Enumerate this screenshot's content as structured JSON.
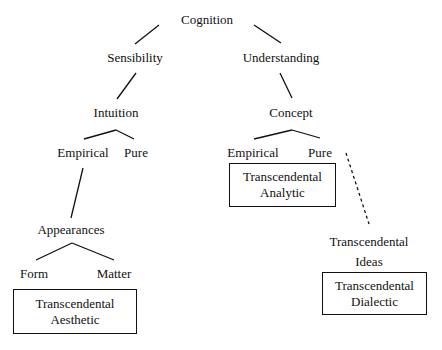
{
  "nodes": {
    "cognition": "Cognition",
    "sensibility": "Sensibility",
    "understanding": "Understanding",
    "intuition": "Intuition",
    "concept": "Concept",
    "intuition_empirical": "Empirical",
    "intuition_pure": "Pure",
    "concept_empirical": "Empirical",
    "concept_pure": "Pure",
    "appearances": "Appearances",
    "form": "Form",
    "matter": "Matter",
    "transcendental_ideas": [
      "Transcendental",
      "Ideas"
    ]
  },
  "boxes": {
    "aesthetic": [
      "Transcendental",
      "Aesthetic"
    ],
    "analytic": [
      "Transcendental",
      "Analytic"
    ],
    "dialectic": [
      "Transcendental",
      "Dialectic"
    ]
  },
  "edges": [
    {
      "from": "Cognition",
      "to": "Sensibility",
      "style": "solid"
    },
    {
      "from": "Cognition",
      "to": "Understanding",
      "style": "solid"
    },
    {
      "from": "Sensibility",
      "to": "Intuition",
      "style": "solid"
    },
    {
      "from": "Understanding",
      "to": "Concept",
      "style": "solid"
    },
    {
      "from": "Intuition",
      "to": "Empirical",
      "style": "solid"
    },
    {
      "from": "Intuition",
      "to": "Pure",
      "style": "solid"
    },
    {
      "from": "Concept",
      "to": "Empirical",
      "style": "solid"
    },
    {
      "from": "Concept",
      "to": "Pure",
      "style": "solid"
    },
    {
      "from": "Empirical",
      "to": "Appearances",
      "style": "solid"
    },
    {
      "from": "Appearances",
      "to": "Form",
      "style": "solid"
    },
    {
      "from": "Appearances",
      "to": "Matter",
      "style": "solid"
    },
    {
      "from": "Pure",
      "to": "Transcendental Ideas",
      "style": "dashed"
    }
  ]
}
